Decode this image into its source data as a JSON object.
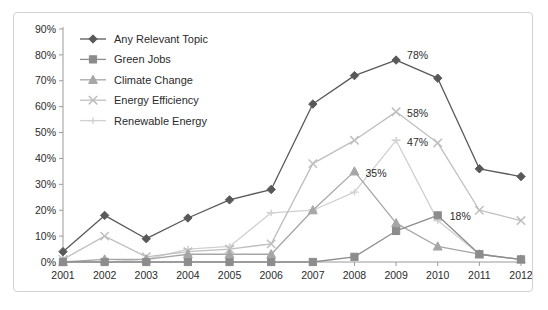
{
  "chart_data": {
    "type": "line",
    "title": "",
    "subtitle": "",
    "xlabel": "",
    "ylabel": "",
    "categories": [
      "2001",
      "2002",
      "2003",
      "2004",
      "2005",
      "2006",
      "2007",
      "2008",
      "2009",
      "2010",
      "2011",
      "2012"
    ],
    "x_tick_labels": [
      "2001",
      "2002",
      "2003",
      "2004",
      "2005",
      "2006",
      "2007",
      "2008",
      "2009",
      "2010",
      "2011",
      "2012"
    ],
    "y_tick_labels": [
      "0%",
      "10%",
      "20%",
      "30%",
      "40%",
      "50%",
      "60%",
      "70%",
      "80%",
      "90%"
    ],
    "y_tick_values": [
      0,
      10,
      20,
      30,
      40,
      50,
      60,
      70,
      80,
      90
    ],
    "ylim": [
      0,
      90
    ],
    "y_axis_format": "percent",
    "grid": false,
    "legend_position": "inside-top-left",
    "series": [
      {
        "name": "Any Relevant Topic",
        "marker": "diamond",
        "color": "#595959",
        "values": [
          4,
          18,
          9,
          17,
          24,
          28,
          61,
          72,
          78,
          71,
          36,
          33
        ]
      },
      {
        "name": "Green Jobs",
        "marker": "square",
        "color": "#8c8c8c",
        "values": [
          0,
          0,
          0,
          0,
          0,
          0,
          0,
          2,
          12,
          18,
          3,
          1
        ]
      },
      {
        "name": "Climate Change",
        "marker": "triangle",
        "color": "#a6a6a6",
        "values": [
          0,
          1,
          1,
          3,
          3,
          3,
          20,
          35,
          15,
          6,
          3,
          1
        ]
      },
      {
        "name": "Energy Efficiency",
        "marker": "x",
        "color": "#bfbfbf",
        "values": [
          1,
          10,
          2,
          4,
          5,
          7,
          38,
          47,
          58,
          46,
          20,
          16
        ]
      },
      {
        "name": "Renewable Energy",
        "marker": "dash",
        "color": "#d0d0d0",
        "values": [
          0,
          0,
          1,
          5,
          6,
          19,
          20,
          27,
          47,
          16,
          3,
          1
        ]
      }
    ],
    "annotations": [
      {
        "text": "78%",
        "series": "Any Relevant Topic",
        "category": "2009",
        "value": 78
      },
      {
        "text": "58%",
        "series": "Energy Efficiency",
        "category": "2009",
        "value": 58
      },
      {
        "text": "47%",
        "series": "Renewable Energy",
        "category": "2009",
        "value": 47
      },
      {
        "text": "35%",
        "series": "Climate Change",
        "category": "2008",
        "value": 35
      },
      {
        "text": "18%",
        "series": "Green Jobs",
        "category": "2010",
        "value": 18
      }
    ]
  },
  "legend": {
    "items": [
      {
        "label": "Any Relevant Topic"
      },
      {
        "label": "Green Jobs"
      },
      {
        "label": "Climate Change"
      },
      {
        "label": "Energy Efficiency"
      },
      {
        "label": "Renewable Energy"
      }
    ]
  },
  "colors": {
    "border": "#d2d2d2",
    "axis": "#9a9a9a",
    "text": "#2b2b2b",
    "background": "#ffffff"
  }
}
